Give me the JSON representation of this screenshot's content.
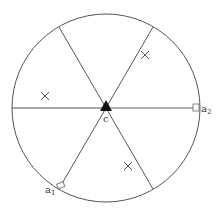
{
  "diagram": {
    "circle": {
      "cx": 106,
      "cy": 108,
      "r": 94,
      "stroke": "#555555"
    },
    "center_label": "c",
    "anchors": [
      {
        "id": "a1",
        "label": "a",
        "sub": "1",
        "x": 62,
        "y": 187
      },
      {
        "id": "a2",
        "label": "a",
        "sub": "2",
        "x": 199,
        "y": 108
      }
    ],
    "axis_color": "#999999",
    "spoke_color": "#555555",
    "crosses": [
      {
        "x": 145,
        "y": 55
      },
      {
        "x": 45,
        "y": 96
      },
      {
        "x": 128,
        "y": 166
      }
    ]
  }
}
